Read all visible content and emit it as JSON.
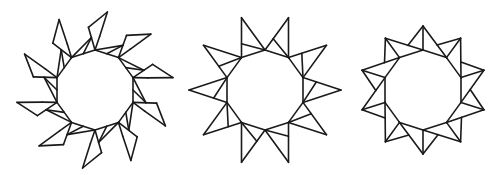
{
  "canvas": {
    "width": 498,
    "height": 175,
    "background": "#ffffff",
    "stroke": "#1a1a1a"
  },
  "figures": [
    {
      "name": "pinwheel-kite-star",
      "center": [
        95,
        90
      ],
      "sides": 10,
      "inner_radius": 40,
      "start_angle": -90,
      "kite": {
        "a": [
          63,
          -6
        ],
        "tip": [
          79,
          9
        ],
        "b": [
          54,
          5
        ]
      }
    },
    {
      "name": "ten-point-star-split-spikes",
      "center": [
        265,
        90
      ],
      "sides": 10,
      "inner_radius": 40,
      "start_angle": -90,
      "tip_radius": 76,
      "inner_line_fraction": 0.65
    },
    {
      "name": "ten-point-star-radial-triangles",
      "center": [
        423,
        90
      ],
      "sides": 10,
      "inner_radius": 40,
      "start_angle": -90,
      "tip_radius": 64,
      "cross_fraction": 0.6
    }
  ]
}
